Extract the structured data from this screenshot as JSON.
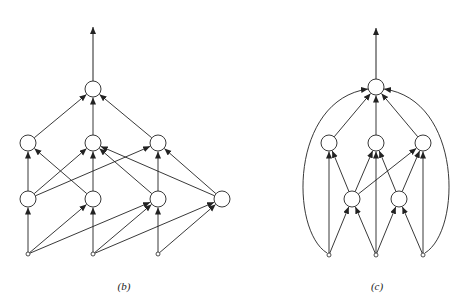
{
  "colors": {
    "stroke": "#222222",
    "background": "#ffffff"
  },
  "panels": [
    {
      "id": "b",
      "label": "(b)",
      "label_pos": [
        124,
        280
      ],
      "output_arrow": {
        "from": [
          93,
          81
        ],
        "to": [
          93,
          27
        ]
      },
      "nodes": [
        {
          "id": "top",
          "x": 93,
          "y": 89,
          "r": 8
        },
        {
          "id": "m1",
          "x": 28,
          "y": 143,
          "r": 8
        },
        {
          "id": "m2",
          "x": 93,
          "y": 143,
          "r": 8
        },
        {
          "id": "m3",
          "x": 158,
          "y": 143,
          "r": 8
        },
        {
          "id": "h1",
          "x": 28,
          "y": 199,
          "r": 8
        },
        {
          "id": "h2",
          "x": 93,
          "y": 199,
          "r": 8
        },
        {
          "id": "h3",
          "x": 158,
          "y": 199,
          "r": 8
        },
        {
          "id": "h4",
          "x": 222,
          "y": 199,
          "r": 8
        },
        {
          "id": "i1",
          "x": 28,
          "y": 254,
          "r": 2
        },
        {
          "id": "i2",
          "x": 93,
          "y": 254,
          "r": 2
        },
        {
          "id": "i3",
          "x": 158,
          "y": 254,
          "r": 2
        }
      ],
      "edges": [
        [
          "m1",
          "top"
        ],
        [
          "m2",
          "top"
        ],
        [
          "m3",
          "top"
        ],
        [
          "h1",
          "m1"
        ],
        [
          "h1",
          "m2"
        ],
        [
          "h1",
          "m3"
        ],
        [
          "h2",
          "m1"
        ],
        [
          "h2",
          "m2"
        ],
        [
          "h3",
          "m2"
        ],
        [
          "h3",
          "m3"
        ],
        [
          "h4",
          "m2"
        ],
        [
          "h4",
          "m3"
        ],
        [
          "i1",
          "h1"
        ],
        [
          "i1",
          "h2"
        ],
        [
          "i1",
          "h3"
        ],
        [
          "i2",
          "h2"
        ],
        [
          "i2",
          "h3"
        ],
        [
          "i2",
          "h4"
        ],
        [
          "i3",
          "h3"
        ],
        [
          "i3",
          "h4"
        ]
      ],
      "arcs": []
    },
    {
      "id": "c",
      "label": "(c)",
      "label_pos": [
        377,
        280
      ],
      "output_arrow": {
        "from": [
          376,
          79
        ],
        "to": [
          376,
          28
        ]
      },
      "nodes": [
        {
          "id": "top",
          "x": 376,
          "y": 87,
          "r": 8
        },
        {
          "id": "m1",
          "x": 329,
          "y": 143,
          "r": 8
        },
        {
          "id": "m2",
          "x": 376,
          "y": 143,
          "r": 8
        },
        {
          "id": "m3",
          "x": 423,
          "y": 143,
          "r": 8
        },
        {
          "id": "h1",
          "x": 352,
          "y": 199,
          "r": 8
        },
        {
          "id": "h2",
          "x": 399,
          "y": 199,
          "r": 8
        },
        {
          "id": "i1",
          "x": 329,
          "y": 255,
          "r": 2
        },
        {
          "id": "i2",
          "x": 376,
          "y": 255,
          "r": 2
        },
        {
          "id": "i3",
          "x": 423,
          "y": 255,
          "r": 2
        }
      ],
      "edges": [
        [
          "m1",
          "top"
        ],
        [
          "m2",
          "top"
        ],
        [
          "m3",
          "top"
        ],
        [
          "h1",
          "m1"
        ],
        [
          "h1",
          "m2"
        ],
        [
          "h1",
          "m3"
        ],
        [
          "h2",
          "m2"
        ],
        [
          "h2",
          "m3"
        ],
        [
          "i1",
          "m1"
        ],
        [
          "i1",
          "h1"
        ],
        [
          "i2",
          "h1"
        ],
        [
          "i2",
          "m2"
        ],
        [
          "i2",
          "h2"
        ],
        [
          "i3",
          "h2"
        ],
        [
          "i3",
          "m3"
        ]
      ],
      "arcs": [
        {
          "from": "i1",
          "to": "top",
          "path": "M327,253 C290,230 290,100 368,89"
        },
        {
          "from": "i3",
          "to": "top",
          "path": "M425,253 C462,230 462,100 384,89"
        }
      ]
    }
  ]
}
